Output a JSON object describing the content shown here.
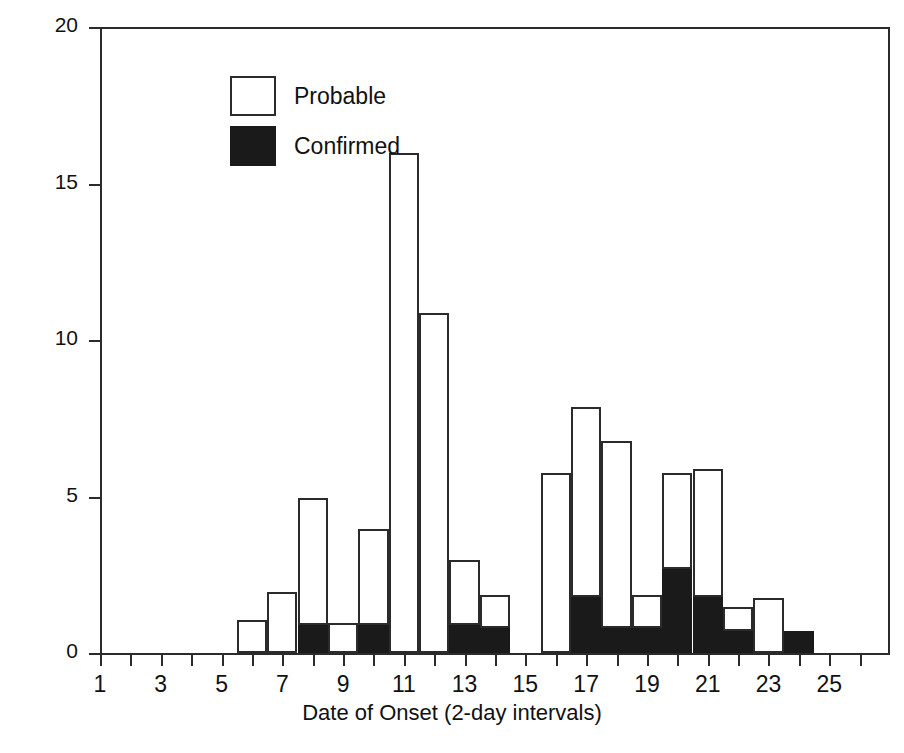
{
  "chart_data": {
    "type": "bar",
    "title": "",
    "subtitle": "",
    "xlabel": "Date of Onset (2-day intervals)",
    "ylabel": "Cases",
    "xlim": [
      0.5,
      26.5
    ],
    "ylim": [
      0,
      20
    ],
    "yticks": [
      0,
      5,
      10,
      15,
      20
    ],
    "xticks": [
      1,
      3,
      5,
      7,
      9,
      11,
      13,
      15,
      17,
      19,
      21,
      23,
      25
    ],
    "grid": false,
    "stacked": true,
    "legend_position": "top-left",
    "bar_style": "histogram-adjacent",
    "categories": [
      1,
      2,
      3,
      4,
      5,
      6,
      7,
      8,
      9,
      10,
      11,
      12,
      13,
      14,
      15,
      16,
      17,
      18,
      19,
      20,
      21,
      22,
      23,
      24,
      25,
      26
    ],
    "series": [
      {
        "name": "Probable",
        "color": "#ffffff",
        "values": [
          0,
          0,
          0,
          0,
          0,
          1,
          1.9,
          4,
          0.9,
          3,
          15.9,
          10.8,
          2,
          1,
          0,
          5.7,
          6,
          5.9,
          1,
          3,
          4,
          0.7,
          1.7,
          0,
          0,
          0
        ]
      },
      {
        "name": "Confirmed",
        "color": "#1a1a1a",
        "values": [
          0,
          0,
          0,
          0,
          0,
          0,
          0,
          0.9,
          0,
          0.9,
          0,
          0,
          0.9,
          0.8,
          0,
          0,
          1.8,
          0.8,
          0.8,
          2.7,
          1.8,
          0.7,
          0,
          0.7,
          0,
          0
        ]
      }
    ],
    "totals": [
      0,
      0,
      0,
      0,
      0,
      1,
      1.9,
      4.9,
      0.9,
      3.9,
      15.9,
      10.8,
      2.9,
      1.8,
      0,
      5.7,
      7.8,
      6.7,
      1.8,
      5.7,
      3.7,
      0.7,
      1.7,
      0.7,
      0,
      0
    ]
  },
  "legend": {
    "items": [
      {
        "label": "Probable",
        "swatch": "hollow"
      },
      {
        "label": "Confirmed",
        "swatch": "filled"
      }
    ]
  },
  "colors": {
    "axis": "#2b2b2b",
    "text": "#111111",
    "probable_fill": "#ffffff",
    "confirmed_fill": "#1a1a1a",
    "background": "#ffffff"
  }
}
